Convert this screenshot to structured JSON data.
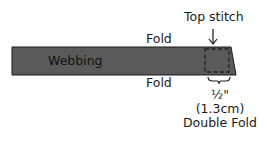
{
  "labels": {
    "top_stitch": "Top stitch",
    "fold_top": "Fold",
    "fold_bottom": "Fold",
    "webbing": "Webbing",
    "half_inch": "½\"",
    "metric": "(1.3cm)",
    "double_fold": "Double Fold"
  },
  "colors": {
    "webbing_fill": "#5a5a5a",
    "outline": "#1a1a1a",
    "background": "#ffffff"
  }
}
